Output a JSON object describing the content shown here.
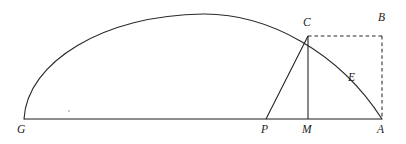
{
  "figure": {
    "background_color": "#ffffff",
    "stroke_color": "#1c1c1c",
    "width": 406,
    "height": 144,
    "labels": {
      "G": "G",
      "P": "P",
      "M": "M",
      "A": "A",
      "C": "C",
      "B": "B",
      "E": "E"
    },
    "points": {
      "G": {
        "x": 24,
        "y": 119
      },
      "P": {
        "x": 266,
        "y": 119
      },
      "M": {
        "x": 308,
        "y": 119
      },
      "A": {
        "x": 382,
        "y": 119
      },
      "C": {
        "x": 308,
        "y": 36
      },
      "B": {
        "x": 382,
        "y": 36
      },
      "apex": {
        "x": 203,
        "y": 14
      }
    },
    "label_positions": {
      "G": {
        "x": 17,
        "y": 124
      },
      "P": {
        "x": 261,
        "y": 124
      },
      "M": {
        "x": 302,
        "y": 124
      },
      "A": {
        "x": 377,
        "y": 124
      },
      "C": {
        "x": 303,
        "y": 18
      },
      "B": {
        "x": 378,
        "y": 13
      },
      "E": {
        "x": 348,
        "y": 73
      }
    },
    "segments": {
      "baseline_GA": "M 24 119 L 382 119",
      "chord_PC": "M 266 119 L 308 36",
      "altitude_CM": "M 308 36 L 308 119",
      "arc_GA": "M 24 119 C 27 62 104 15 203 14 C 268 13.5 339 52 382 119",
      "dashed_CB": "M 308 36 L 382 36",
      "dashed_BA": "M 382 36 L 382 119"
    },
    "artifact": {
      "x": 68,
      "y": 110
    }
  }
}
